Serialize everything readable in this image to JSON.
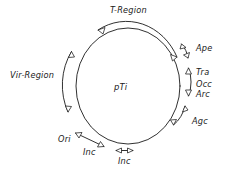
{
  "diagram": {
    "title_center": "pTi",
    "type": "circular-plasmid-map",
    "background_color": "#ffffff",
    "stroke_color": "#1a1a1a",
    "circle": {
      "center_x": 128,
      "center_y": 86,
      "radius": 52
    },
    "regions": [
      {
        "id": "t-region",
        "label": "T-Region",
        "arc_span_degrees": 84,
        "arrow_ends": "double",
        "position": "top"
      },
      {
        "id": "ape",
        "label": "Ape",
        "arc_span_degrees": 20,
        "arrow_ends": "double",
        "position": "upper-right"
      },
      {
        "id": "tra-occ-arc",
        "label_lines": [
          "Tra",
          "Occ",
          "Arc"
        ],
        "arc_span_degrees": 30,
        "arrow_ends": "double",
        "position": "right"
      },
      {
        "id": "agc",
        "label": "Agc",
        "arc_span_degrees": 24,
        "arrow_ends": "double",
        "position": "lower-right"
      },
      {
        "id": "inc-lower",
        "label": "Inc",
        "arc_span_degrees": 16,
        "arrow_ends": "double",
        "position": "bottom"
      },
      {
        "id": "inc-ori",
        "label": "Inc",
        "arc_span_degrees": 22,
        "arrow_ends": "double",
        "position": "bottom-left"
      },
      {
        "id": "ori",
        "label": "Ori",
        "arrow_ends": "none",
        "position": "lower-left"
      },
      {
        "id": "vir-region",
        "label": "Vir-Region",
        "arc_span_degrees": 58,
        "arrow_ends": "double",
        "position": "left"
      }
    ]
  }
}
